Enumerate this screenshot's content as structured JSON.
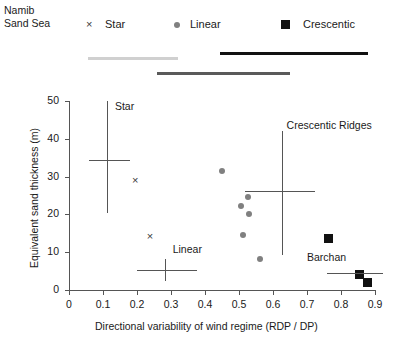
{
  "header": {
    "title": "Namib\nSand Sea"
  },
  "legend": {
    "position": "top",
    "items": [
      {
        "symbol": "x-mark",
        "label": "Star",
        "color": "#3a3a3a"
      },
      {
        "symbol": "circle",
        "label": "Linear",
        "color": "#808080"
      },
      {
        "symbol": "square",
        "label": "Crescentic",
        "color": "#111111"
      }
    ]
  },
  "range_bars": [
    {
      "name": "star-range-bar",
      "color": "#d0d0d0",
      "x_start": 0.055,
      "x_end": 0.32
    },
    {
      "name": "linear-range-bar",
      "color": "#5a5a5a",
      "x_start": 0.26,
      "x_end": 0.65
    },
    {
      "name": "crescentic-range-bar",
      "color": "#111111",
      "x_start": 0.445,
      "x_end": 0.88
    }
  ],
  "chart_data": {
    "type": "scatter",
    "title": "",
    "xlabel": "Directional variability of wind regime (RDP / DP)",
    "ylabel": "Equivalent sand thickness (m)",
    "xlim": [
      0,
      0.9
    ],
    "ylim": [
      0,
      50
    ],
    "xticks": [
      "0",
      "0.1",
      "0.2",
      "0.3",
      "0.4",
      "0.5",
      "0.6",
      "0.7",
      "0.8",
      "0.9"
    ],
    "xtick_values": [
      0,
      0.1,
      0.2,
      0.3,
      0.4,
      0.5,
      0.6,
      0.7,
      0.8,
      0.9
    ],
    "yticks": [
      "0",
      "10",
      "20",
      "30",
      "40",
      "50"
    ],
    "ytick_values": [
      0,
      10,
      20,
      30,
      40,
      50
    ],
    "grid": false,
    "series": [
      {
        "name": "Star",
        "symbol": "x-mark",
        "color": "#3a3a3a",
        "points": [
          {
            "x": 0.195,
            "y": 29.0
          },
          {
            "x": 0.238,
            "y": 14.2
          }
        ]
      },
      {
        "name": "Linear",
        "symbol": "circle",
        "color": "#808080",
        "points": [
          {
            "x": 0.45,
            "y": 31.5
          },
          {
            "x": 0.527,
            "y": 24.5
          },
          {
            "x": 0.506,
            "y": 22.3
          },
          {
            "x": 0.53,
            "y": 20.2
          },
          {
            "x": 0.512,
            "y": 14.5
          },
          {
            "x": 0.562,
            "y": 8.3
          }
        ]
      },
      {
        "name": "Crescentic",
        "symbol": "square",
        "color": "#111111",
        "points": [
          {
            "x": 0.762,
            "y": 13.5
          },
          {
            "x": 0.855,
            "y": 4.0
          },
          {
            "x": 0.878,
            "y": 2.0
          }
        ]
      }
    ],
    "annotations": [
      {
        "name": "star-cross",
        "label": "Star",
        "type": "cross",
        "x": 0.113,
        "y": 34.5,
        "x_min": 0.06,
        "x_max": 0.18,
        "y_min": 20.5,
        "y_max": 50.0,
        "label_x": 0.135,
        "label_y": 48.5
      },
      {
        "name": "linear-cross",
        "label": "Linear",
        "type": "cross",
        "x": 0.283,
        "y": 5.2,
        "x_min": 0.2,
        "x_max": 0.375,
        "y_min": 2.3,
        "y_max": 8.2,
        "label_x": 0.305,
        "label_y": 10.5
      },
      {
        "name": "crescentic-ridges-cross",
        "label": "Crescentic Ridges",
        "type": "cross",
        "x": 0.625,
        "y": 26.2,
        "x_min": 0.518,
        "x_max": 0.725,
        "y_min": 9.3,
        "y_max": 42.0,
        "label_x": 0.64,
        "label_y": 43.5
      },
      {
        "name": "barchan-bar",
        "label": "Barchan",
        "type": "hline",
        "x_min": 0.76,
        "x_max": 0.925,
        "y": 4.5,
        "label_x": 0.7,
        "label_y": 8.5
      }
    ]
  }
}
